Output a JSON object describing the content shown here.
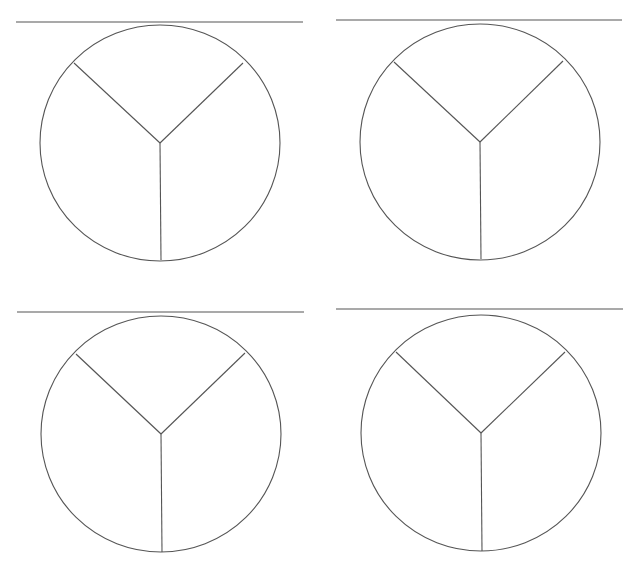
{
  "page": {
    "width": 635,
    "height": 568,
    "background": "#ffffff"
  },
  "style": {
    "stroke": "#555555",
    "stroke_width": 1.1
  },
  "diagrams": [
    {
      "id": "top-left",
      "rule": {
        "x1": 16,
        "x2": 303,
        "y": 22
      },
      "circle": {
        "cx": 160,
        "cy": 143,
        "rx": 120,
        "ry": 118
      },
      "spokes": [
        {
          "x": 74,
          "y": 63
        },
        {
          "x": 243,
          "y": 63
        },
        {
          "x": 161,
          "y": 260
        }
      ]
    },
    {
      "id": "top-right",
      "rule": {
        "x1": 336,
        "x2": 622,
        "y": 20
      },
      "circle": {
        "cx": 480,
        "cy": 142,
        "rx": 120,
        "ry": 118
      },
      "spokes": [
        {
          "x": 394,
          "y": 62
        },
        {
          "x": 563,
          "y": 61
        },
        {
          "x": 481,
          "y": 259
        }
      ]
    },
    {
      "id": "bottom-left",
      "rule": {
        "x1": 17,
        "x2": 304,
        "y": 312
      },
      "circle": {
        "cx": 161,
        "cy": 434,
        "rx": 120,
        "ry": 118
      },
      "spokes": [
        {
          "x": 76,
          "y": 354
        },
        {
          "x": 245,
          "y": 353
        },
        {
          "x": 162,
          "y": 552
        }
      ]
    },
    {
      "id": "bottom-right",
      "rule": {
        "x1": 336,
        "x2": 623,
        "y": 309
      },
      "circle": {
        "cx": 481,
        "cy": 433,
        "rx": 120,
        "ry": 118
      },
      "spokes": [
        {
          "x": 396,
          "y": 352
        },
        {
          "x": 565,
          "y": 352
        },
        {
          "x": 482,
          "y": 551
        }
      ]
    }
  ]
}
